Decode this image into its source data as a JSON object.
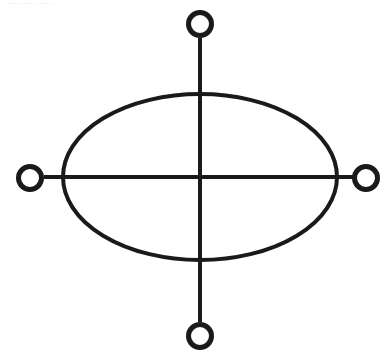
{
  "page": {
    "width": 389,
    "height": 358,
    "background_color": "#ffffff",
    "stroke_color": "#1a1a1a",
    "fill_color": "none"
  },
  "header": {
    "caption_text": "·· ······ ········· ········",
    "caption_color": "#9a9aa2"
  },
  "figure": {
    "type": "line-diagram",
    "center": {
      "x": 200,
      "y": 177
    },
    "ellipse": {
      "name": "central-ellipse",
      "cx": 200,
      "cy": 177,
      "rx": 137,
      "ry": 83,
      "stroke_width": 4
    },
    "axes": [
      {
        "name": "vertical-axis-line",
        "orientation": "vertical",
        "x1": 200,
        "y1": 38,
        "x2": 200,
        "y2": 322,
        "stroke_width": 4
      },
      {
        "name": "horizontal-axis-line",
        "orientation": "horizontal",
        "x1": 44,
        "y1": 177,
        "x2": 353,
        "y2": 177,
        "stroke_width": 4
      }
    ],
    "nodes": [
      {
        "name": "node-top",
        "position": "top",
        "cx": 200,
        "cy": 24,
        "r": 11.5,
        "stroke_width": 5
      },
      {
        "name": "node-right",
        "position": "right",
        "cx": 366,
        "cy": 178,
        "r": 11.5,
        "stroke_width": 5
      },
      {
        "name": "node-bottom",
        "position": "bottom",
        "cx": 200,
        "cy": 336,
        "r": 11.5,
        "stroke_width": 5
      },
      {
        "name": "node-left",
        "position": "left",
        "cx": 30,
        "cy": 178,
        "r": 11.5,
        "stroke_width": 5
      }
    ]
  }
}
